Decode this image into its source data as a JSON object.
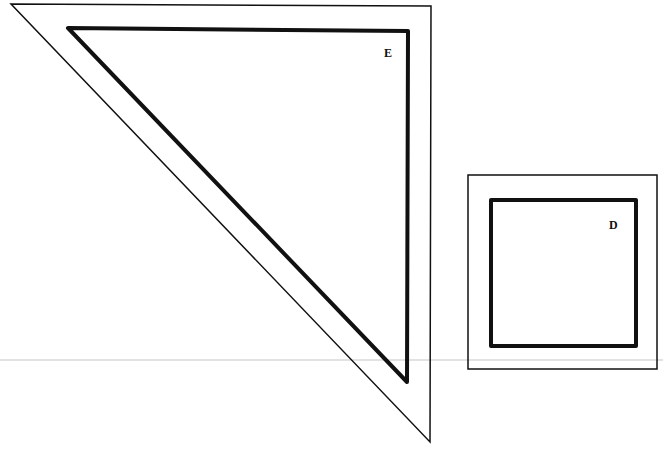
{
  "diagram": {
    "shapes": [
      {
        "id": "E",
        "type": "triangle",
        "label": "E",
        "outer_points": [
          [
            11,
            4
          ],
          [
            431,
            6
          ],
          [
            430,
            442
          ]
        ],
        "inner_points": [
          [
            68,
            28
          ],
          [
            408,
            31
          ],
          [
            407,
            382
          ]
        ]
      },
      {
        "id": "D",
        "type": "square",
        "label": "D",
        "outer": {
          "x": 468,
          "y": 175,
          "w": 189,
          "h": 194
        },
        "inner": {
          "x": 491,
          "y": 200,
          "w": 145,
          "h": 146
        }
      }
    ],
    "colors": {
      "stroke": "#111111",
      "background": "#ffffff",
      "scan_line": "#dcdcdc"
    }
  }
}
